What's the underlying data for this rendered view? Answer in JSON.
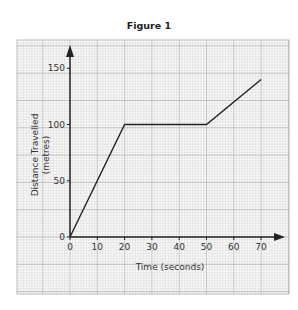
{
  "figure": {
    "title": "Figure 1"
  },
  "chart_data": {
    "type": "line",
    "title": "Figure 1",
    "xlabel": "Time (seconds)",
    "ylabel": "Distance Travelled",
    "ylabel_units": "(metres)",
    "x_ticks": [
      0,
      10,
      20,
      30,
      40,
      50,
      60,
      70
    ],
    "y_ticks": [
      0,
      50,
      100,
      150
    ],
    "xlim": [
      0,
      78
    ],
    "ylim": [
      0,
      162
    ],
    "grid": true,
    "legend": null,
    "series": [
      {
        "name": "Distance",
        "x": [
          0,
          20,
          50,
          70
        ],
        "y": [
          0,
          100,
          100,
          140
        ]
      }
    ]
  },
  "colors": {
    "grid_minor": "#d6d6d6",
    "grid_major": "#a8a8a8",
    "axis": "#222222",
    "line": "#222222"
  }
}
